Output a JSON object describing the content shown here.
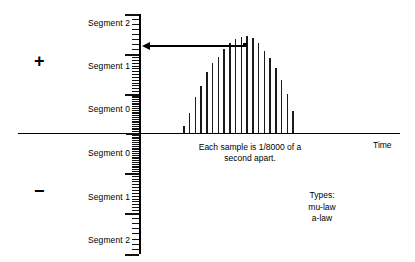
{
  "diagram": {
    "axes": {
      "time_label": "Time",
      "horizontal_axis_name": "time-axis",
      "vertical_axis_name": "amplitude-axis"
    },
    "polarity": {
      "positive_sign": "+",
      "negative_sign": "−"
    },
    "segments_positive": [
      {
        "label": "Segment 2"
      },
      {
        "label": "Segment 1"
      },
      {
        "label": "Segment 0"
      }
    ],
    "segments_negative": [
      {
        "label": "Segment 0"
      },
      {
        "label": "Segment 1"
      },
      {
        "label": "Segment 2"
      }
    ],
    "annotations": {
      "sample_rate_note_line1": "Each sample is 1/8000 of a",
      "sample_rate_note_line2": "second apart.",
      "types_heading": "Types:",
      "types": [
        {
          "name": "mu-law"
        },
        {
          "name": "a-law"
        }
      ]
    },
    "colors": {
      "ink": "#000000",
      "bar": "#1a1a1a",
      "background": "#ffffff"
    }
  },
  "chart_data": {
    "type": "bar",
    "xlabel": "Time",
    "ylabel": "Amplitude (companded segments)",
    "grid": false,
    "legend": null,
    "categories": [
      "s1",
      "s2",
      "s3",
      "s4",
      "s5",
      "s6",
      "s7",
      "s8",
      "s9",
      "s10",
      "s11",
      "s12",
      "s13",
      "s14",
      "s15",
      "s16",
      "s17",
      "s18",
      "s19",
      "s20"
    ],
    "values": [
      7,
      20,
      37,
      48,
      62,
      71,
      78,
      86,
      92,
      96,
      98,
      99,
      97,
      92,
      84,
      77,
      66,
      54,
      40,
      22
    ],
    "ylim": [
      0,
      100
    ],
    "marked_sample_index": 10,
    "marked_sample_note": "Arrow points from the marked peak sample back to the quantization scale"
  }
}
